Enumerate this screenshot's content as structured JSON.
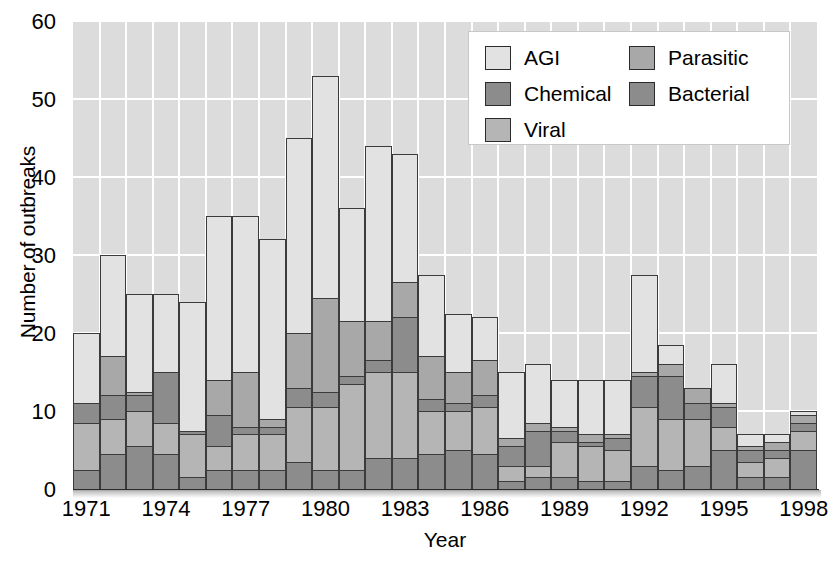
{
  "chart_data": {
    "type": "bar",
    "subtype": "stacked-bar",
    "title": "",
    "xlabel": "Year",
    "ylabel": "Number of outbreaks",
    "ylim": [
      0,
      60
    ],
    "yticks": [
      0,
      10,
      20,
      30,
      40,
      50,
      60
    ],
    "xtick_labels": [
      "1971",
      "1974",
      "1977",
      "1980",
      "1983",
      "1986",
      "1989",
      "1992",
      "1995",
      "1998"
    ],
    "grid": true,
    "legend_position": "top-right",
    "categories": [
      "1971",
      "1972",
      "1973",
      "1974",
      "1975",
      "1976",
      "1977",
      "1978",
      "1979",
      "1980",
      "1981",
      "1982",
      "1983",
      "1984",
      "1985",
      "1986",
      "1987",
      "1988",
      "1989",
      "1990",
      "1991",
      "1992",
      "1993",
      "1994",
      "1995",
      "1996",
      "1997",
      "1998"
    ],
    "series": [
      {
        "name": "Bacterial",
        "color": "#8c8c8c",
        "values": [
          2.5,
          4.5,
          5.5,
          4.5,
          1.5,
          2.5,
          2.5,
          2.5,
          3.5,
          2.5,
          2.5,
          4.0,
          4.0,
          4.5,
          5.0,
          4.5,
          1.0,
          1.5,
          1.5,
          1.0,
          1.0,
          3.0,
          2.5,
          3.0,
          5.0,
          1.5,
          1.5,
          5.0
        ]
      },
      {
        "name": "Viral",
        "color": "#b5b5b5",
        "values": [
          6.0,
          4.5,
          4.5,
          4.0,
          5.5,
          3.0,
          4.5,
          4.5,
          7.0,
          8.0,
          11.0,
          11.0,
          11.0,
          5.5,
          5.0,
          6.0,
          2.0,
          1.5,
          4.5,
          4.5,
          4.0,
          7.5,
          6.5,
          6.0,
          3.0,
          2.0,
          2.5,
          2.5
        ]
      },
      {
        "name": "Chemical",
        "color": "#8c8c8c",
        "values": [
          2.5,
          3.0,
          2.0,
          6.5,
          0.5,
          4.0,
          1.0,
          1.0,
          2.5,
          2.0,
          1.0,
          1.5,
          7.0,
          1.5,
          1.0,
          1.5,
          2.5,
          4.5,
          1.5,
          0.5,
          1.5,
          4.0,
          5.5,
          2.0,
          2.5,
          1.5,
          1.0,
          1.0
        ]
      },
      {
        "name": "Parasitic",
        "color": "#a8a8a8",
        "values": [
          0.0,
          5.0,
          0.5,
          0.0,
          0.0,
          4.5,
          7.0,
          1.0,
          7.0,
          12.0,
          7.0,
          5.0,
          4.5,
          5.5,
          4.0,
          4.5,
          1.0,
          1.0,
          0.5,
          1.0,
          0.5,
          0.5,
          1.5,
          2.0,
          0.5,
          0.5,
          1.0,
          1.0
        ]
      },
      {
        "name": "AGI",
        "color": "#e2e2e2",
        "values": [
          9.0,
          13.0,
          12.5,
          10.0,
          16.5,
          21.0,
          20.0,
          23.0,
          25.0,
          28.5,
          14.5,
          22.5,
          16.5,
          10.5,
          7.5,
          5.5,
          8.5,
          7.5,
          6.0,
          7.0,
          7.0,
          12.5,
          2.5,
          0.0,
          5.0,
          1.5,
          1.0,
          0.5
        ]
      }
    ],
    "totals": [
      20,
      30,
      25,
      25,
      24,
      35,
      34,
      32,
      45,
      53,
      36,
      44,
      43,
      27.5,
      22.5,
      22,
      15,
      16,
      14,
      14,
      14,
      27.5,
      18.5,
      13,
      16,
      7,
      7,
      10
    ]
  },
  "legend": {
    "items": [
      {
        "label": "AGI",
        "color": "#e2e2e2",
        "column": 0
      },
      {
        "label": "Chemical",
        "color": "#8c8c8c",
        "column": 0
      },
      {
        "label": "Viral",
        "color": "#b5b5b5",
        "column": 0
      },
      {
        "label": "Parasitic",
        "color": "#a8a8a8",
        "column": 1
      },
      {
        "label": "Bacterial",
        "color": "#8c8c8c",
        "column": 1
      }
    ]
  },
  "axes": {
    "ylabel": "Number of outbreaks",
    "xlabel": "Year"
  }
}
